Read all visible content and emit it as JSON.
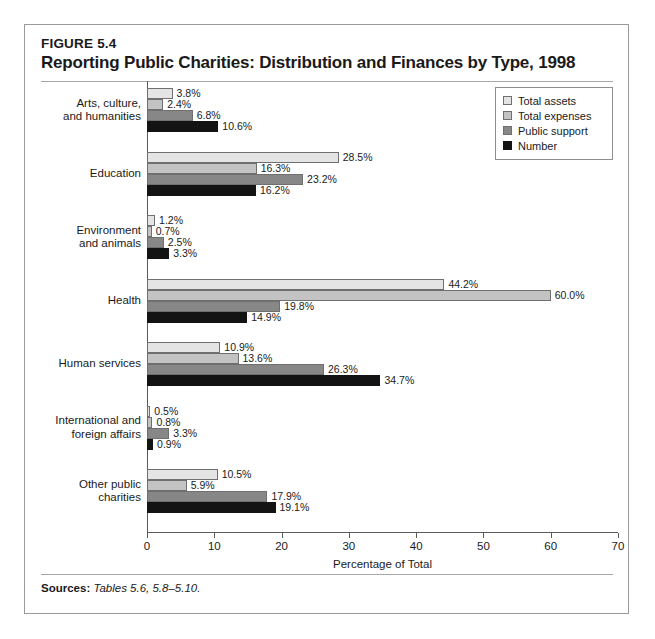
{
  "figure": {
    "number": "FIGURE 5.4",
    "title": "Reporting Public Charities: Distribution and Finances by Type, 1998",
    "sources_label": "Sources:",
    "sources_text": "Tables 5.6, 5.8–5.10."
  },
  "chart_data": {
    "type": "bar",
    "orientation": "horizontal",
    "title": "Reporting Public Charities: Distribution and Finances by Type, 1998",
    "xlabel": "Percentage of Total",
    "ylabel": "",
    "xlim": [
      0,
      70
    ],
    "xticks": [
      0,
      10,
      20,
      30,
      40,
      50,
      60,
      70
    ],
    "xtick_labels": [
      "0",
      "10",
      "20",
      "30",
      "40",
      "50",
      "60",
      "70"
    ],
    "grid": false,
    "legend_position": "top-right",
    "categories": [
      "Arts, culture, and humanities",
      "Education",
      "Environment and animals",
      "Health",
      "Human services",
      "International and foreign affairs",
      "Other public charities"
    ],
    "category_lines": [
      [
        "Arts, culture,",
        "and humanities"
      ],
      [
        "Education"
      ],
      [
        "Environment",
        "and animals"
      ],
      [
        "Health"
      ],
      [
        "Human services"
      ],
      [
        "International and",
        "foreign affairs"
      ],
      [
        "Other public",
        "charities"
      ]
    ],
    "series": [
      {
        "name": "Total assets",
        "color": "#e4e4e4",
        "values": [
          3.8,
          28.5,
          1.2,
          44.2,
          10.9,
          0.5,
          10.5
        ],
        "labels": [
          "3.8%",
          "28.5%",
          "1.2%",
          "44.2%",
          "10.9%",
          "0.5%",
          "10.5%"
        ]
      },
      {
        "name": "Total expenses",
        "color": "#c3c3c3",
        "values": [
          2.4,
          16.3,
          0.7,
          60.0,
          13.6,
          0.8,
          5.9
        ],
        "labels": [
          "2.4%",
          "16.3%",
          "0.7%",
          "60.0%",
          "13.6%",
          "0.8%",
          "5.9%"
        ]
      },
      {
        "name": "Public support",
        "color": "#878787",
        "values": [
          6.8,
          23.2,
          2.5,
          19.8,
          26.3,
          3.3,
          17.9
        ],
        "labels": [
          "6.8%",
          "23.2%",
          "2.5%",
          "19.8%",
          "26.3%",
          "3.3%",
          "17.9%"
        ]
      },
      {
        "name": "Number",
        "color": "#131313",
        "values": [
          10.6,
          16.2,
          3.3,
          14.9,
          34.7,
          0.9,
          19.1
        ],
        "labels": [
          "10.6%",
          "16.2%",
          "3.3%",
          "14.9%",
          "34.7%",
          "0.9%",
          "19.1%"
        ]
      }
    ]
  }
}
